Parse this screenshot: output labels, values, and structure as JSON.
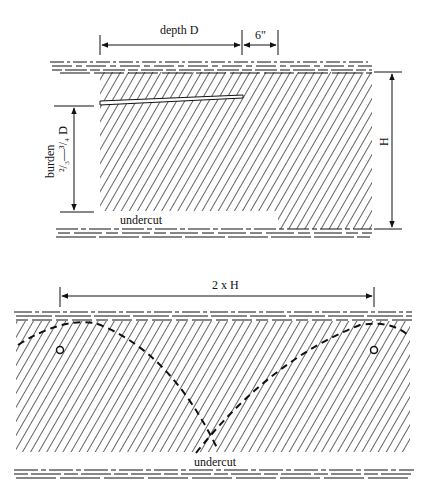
{
  "top_diagram": {
    "labels": {
      "depth": "depth D",
      "clearance": "6\"",
      "burden": "burden",
      "burden_ratio": "²/₃—³/₄ D",
      "height": "H",
      "undercut": "undercut"
    }
  },
  "bottom_diagram": {
    "labels": {
      "span": "2 x H",
      "undercut": "undercut"
    }
  },
  "colors": {
    "ink": "#111111",
    "background": "#ffffff"
  }
}
